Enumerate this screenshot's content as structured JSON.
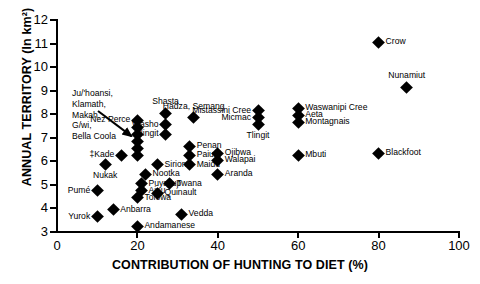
{
  "chart_data": {
    "type": "scatter",
    "title": "",
    "xlabel": "CONTRIBUTION OF HUNTING TO DIET (%)",
    "ylabel": "ANNUAL TERRITORY (ln km²)",
    "xlim": [
      0,
      100
    ],
    "ylim": [
      3,
      12
    ],
    "xticks": [
      0,
      20,
      40,
      60,
      80,
      100
    ],
    "yticks": [
      3,
      4,
      5,
      6,
      7,
      8,
      9,
      10,
      11,
      12
    ],
    "grid": false,
    "legend": "none",
    "marker": "filled-diamond",
    "marker_color": "#000000",
    "points": [
      {
        "label": "Yurok",
        "x": 10,
        "y": 3.65,
        "label_pos": "l"
      },
      {
        "label": "Pumé",
        "x": 10,
        "y": 4.75,
        "label_pos": "l"
      },
      {
        "label": "Nukak",
        "x": 12,
        "y": 5.85,
        "label_pos": "c-below"
      },
      {
        "label": "Anbarra",
        "x": 14,
        "y": 3.95,
        "label_pos": "r"
      },
      {
        "label": "‡Kade",
        "x": 16,
        "y": 6.25,
        "label_pos": "l"
      },
      {
        "label": "Ju/'hoansi",
        "x": 20,
        "y": 7.45,
        "label_pos": "callout"
      },
      {
        "label": "Klamath",
        "x": 20,
        "y": 7.15,
        "label_pos": "callout"
      },
      {
        "label": "Makah",
        "x": 20,
        "y": 6.85,
        "label_pos": "callout"
      },
      {
        "label": "G/wi",
        "x": 20,
        "y": 6.55,
        "label_pos": "callout"
      },
      {
        "label": "Bella Coola",
        "x": 20,
        "y": 6.25,
        "label_pos": "callout"
      },
      {
        "label": "Nez Perce",
        "x": 20,
        "y": 7.75,
        "label_pos": "l"
      },
      {
        "label": "Tolowa",
        "x": 20,
        "y": 4.45,
        "label_pos": "r"
      },
      {
        "label": "Andamanese",
        "x": 20,
        "y": 3.25,
        "label_pos": "r"
      },
      {
        "label": "Ainu",
        "x": 21,
        "y": 4.75,
        "label_pos": "r"
      },
      {
        "label": "Puyallup",
        "x": 21,
        "y": 5.05,
        "label_pos": "r"
      },
      {
        "label": "Nootka",
        "x": 22,
        "y": 5.45,
        "label_pos": "r"
      },
      {
        "label": "Siriono",
        "x": 25,
        "y": 5.85,
        "label_pos": "r"
      },
      {
        "label": "Quinault",
        "x": 25,
        "y": 4.65,
        "label_pos": "r"
      },
      {
        "label": "Tlingit",
        "x": 27,
        "y": 7.15,
        "label_pos": "l"
      },
      {
        "label": "Washo",
        "x": 27,
        "y": 7.55,
        "label_pos": "l"
      },
      {
        "label": "Shasta",
        "x": 27,
        "y": 8.05,
        "label_pos": "c-above"
      },
      {
        "label": "Twana",
        "x": 28,
        "y": 5.05,
        "label_pos": "r"
      },
      {
        "label": "Vedda",
        "x": 31,
        "y": 3.75,
        "label_pos": "r"
      },
      {
        "label": "Maidu",
        "x": 33,
        "y": 5.85,
        "label_pos": "r"
      },
      {
        "label": "Paiute",
        "x": 33,
        "y": 6.25,
        "label_pos": "r"
      },
      {
        "label": "Penan",
        "x": 33,
        "y": 6.65,
        "label_pos": "r"
      },
      {
        "label": "Hadza, Semang",
        "x": 34,
        "y": 7.85,
        "label_pos": "c-above"
      },
      {
        "label": "Aranda",
        "x": 40,
        "y": 5.45,
        "label_pos": "r"
      },
      {
        "label": "Walapai",
        "x": 40,
        "y": 6.05,
        "label_pos": "r"
      },
      {
        "label": "Ojibwa",
        "x": 40,
        "y": 6.35,
        "label_pos": "r"
      },
      {
        "label": "Tlingit",
        "x": 50,
        "y": 7.55,
        "label_pos": "c-below"
      },
      {
        "label": "Micmac",
        "x": 50,
        "y": 7.85,
        "label_pos": "l"
      },
      {
        "label": "Mistassini Cree",
        "x": 50,
        "y": 8.15,
        "label_pos": "l"
      },
      {
        "label": "Mbuti",
        "x": 60,
        "y": 6.25,
        "label_pos": "r"
      },
      {
        "label": "Montagnais",
        "x": 60,
        "y": 7.65,
        "label_pos": "r"
      },
      {
        "label": "Aeta",
        "x": 60,
        "y": 7.95,
        "label_pos": "r"
      },
      {
        "label": "Waswanipi Cree",
        "x": 60,
        "y": 8.25,
        "label_pos": "r"
      },
      {
        "label": "Blackfoot",
        "x": 80,
        "y": 6.35,
        "label_pos": "r"
      },
      {
        "label": "Crow",
        "x": 80,
        "y": 11.05,
        "label_pos": "r"
      },
      {
        "label": "Nunamiut",
        "x": 87,
        "y": 9.15,
        "label_pos": "c-above"
      }
    ],
    "annotation": {
      "lines": [
        "Ju/'hoansi,",
        "Klamath,",
        "Makah,",
        "G/wi,",
        "Bella Coola"
      ],
      "points_to_x": 20,
      "points_to_y": 6.9
    }
  }
}
